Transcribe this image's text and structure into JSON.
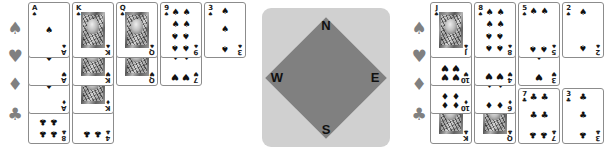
{
  "suit_glyphs": {
    "spade": "♠",
    "heart": "♥",
    "diamond": "♦",
    "club": "♣"
  },
  "suit_labels": {
    "spade": "spades",
    "heart": "hearts",
    "diamond": "diamonds",
    "club": "clubs"
  },
  "compass": {
    "north": "N",
    "south": "S",
    "west": "W",
    "east": "E",
    "face_color": "#d0d0d0",
    "diamond_color": "#808080"
  },
  "colors": {
    "suit_marker": "#808080",
    "card_border": "#8c8c8c",
    "card_face": "#ffffff",
    "pip_ink": "#111111",
    "background": "#ffffff"
  },
  "hands": {
    "left": {
      "name": "West",
      "rows": [
        {
          "suit": "spade",
          "suit_glyph": "♠",
          "cards": [
            {
              "rank": "A",
              "suit_glyph": "♠",
              "pips": 1,
              "court": false
            },
            {
              "rank": "K",
              "suit_glyph": "♠",
              "pips": 0,
              "court": true
            },
            {
              "rank": "Q",
              "suit_glyph": "♠",
              "pips": 0,
              "court": true
            },
            {
              "rank": "9",
              "suit_glyph": "♠",
              "pips": 9,
              "court": false
            },
            {
              "rank": "3",
              "suit_glyph": "♠",
              "pips": 3,
              "court": false
            }
          ]
        },
        {
          "suit": "heart",
          "suit_glyph": "♥",
          "cards": [
            {
              "rank": "A",
              "suit_glyph": "♥",
              "pips": 1,
              "court": false
            },
            {
              "rank": "K",
              "suit_glyph": "♥",
              "pips": 0,
              "court": true
            },
            {
              "rank": "Q",
              "suit_glyph": "♥",
              "pips": 0,
              "court": true
            },
            {
              "rank": "7",
              "suit_glyph": "♥",
              "pips": 7,
              "court": false
            }
          ]
        },
        {
          "suit": "diamond",
          "suit_glyph": "♦",
          "cards": [
            {
              "rank": "A",
              "suit_glyph": "♦",
              "pips": 1,
              "court": false
            },
            {
              "rank": "K",
              "suit_glyph": "♦",
              "pips": 0,
              "court": true
            }
          ]
        },
        {
          "suit": "club",
          "suit_glyph": "♣",
          "cards": [
            {
              "rank": "8",
              "suit_glyph": "♣",
              "pips": 8,
              "court": false
            },
            {
              "rank": "4",
              "suit_glyph": "♣",
              "pips": 4,
              "court": false
            }
          ]
        }
      ]
    },
    "right": {
      "name": "East",
      "rows": [
        {
          "suit": "spade",
          "suit_glyph": "♠",
          "cards": [
            {
              "rank": "J",
              "suit_glyph": "♠",
              "pips": 0,
              "court": true
            },
            {
              "rank": "8",
              "suit_glyph": "♠",
              "pips": 8,
              "court": false
            },
            {
              "rank": "5",
              "suit_glyph": "♠",
              "pips": 5,
              "court": false
            },
            {
              "rank": "2",
              "suit_glyph": "♠",
              "pips": 2,
              "court": false
            }
          ]
        },
        {
          "suit": "heart",
          "suit_glyph": "♥",
          "cards": [
            {
              "rank": "10",
              "suit_glyph": "♥",
              "pips": 10,
              "court": false
            },
            {
              "rank": "4",
              "suit_glyph": "♥",
              "pips": 4,
              "court": false
            },
            {
              "rank": "3",
              "suit_glyph": "♥",
              "pips": 3,
              "court": false
            }
          ]
        },
        {
          "suit": "diamond",
          "suit_glyph": "♦",
          "cards": [
            {
              "rank": "10",
              "suit_glyph": "♦",
              "pips": 10,
              "court": false
            },
            {
              "rank": "6",
              "suit_glyph": "♦",
              "pips": 6,
              "court": false
            }
          ]
        },
        {
          "suit": "club",
          "suit_glyph": "♣",
          "cards": [
            {
              "rank": "K",
              "suit_glyph": "♣",
              "pips": 0,
              "court": true
            },
            {
              "rank": "Q",
              "suit_glyph": "♣",
              "pips": 0,
              "court": true
            },
            {
              "rank": "7",
              "suit_glyph": "♣",
              "pips": 7,
              "court": false
            },
            {
              "rank": "3",
              "suit_glyph": "♣",
              "pips": 3,
              "court": false
            }
          ]
        }
      ]
    }
  }
}
